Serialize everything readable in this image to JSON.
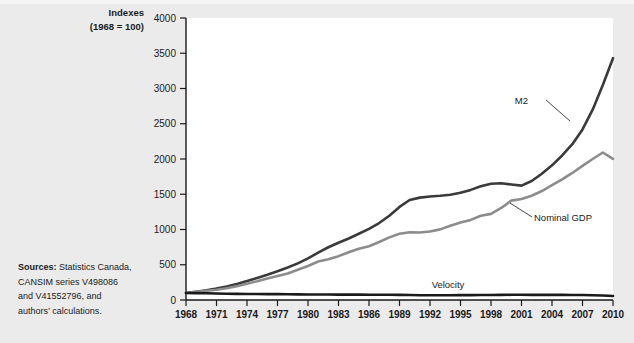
{
  "figure": {
    "background_color": "#ebebeb",
    "plot_background_color": "#ffffff",
    "axis_title_line1": "Indexes",
    "axis_title_line2": "(1968 = 100)"
  },
  "sources": {
    "label": "Sources:",
    "lines": [
      "Statistics Canada,",
      "CANSIM series V498086",
      "and V41552796, and",
      "authors’ calculations."
    ],
    "full_text": "Sources: Statistics Canada, CANSIM series V498086 and V41552796, and authors’ calculations."
  },
  "chart_data": {
    "type": "line",
    "title": "",
    "subtitle": "",
    "xlabel": "",
    "ylabel": "Indexes (1968 = 100)",
    "xlim": [
      1968,
      2010
    ],
    "ylim": [
      0,
      4000
    ],
    "grid": false,
    "legend_position": "inline-annotations",
    "ytick_labels": [
      "0",
      "500",
      "1000",
      "1500",
      "2000",
      "2500",
      "3000",
      "3500",
      "4000"
    ],
    "yticks": [
      0,
      500,
      1000,
      1500,
      2000,
      2500,
      3000,
      3500,
      4000
    ],
    "xtick_labels": [
      "1968",
      "1971",
      "1974",
      "1977",
      "1980",
      "1983",
      "1986",
      "1989",
      "1992",
      "1995",
      "1998",
      "2001",
      "2004",
      "2007",
      "2010"
    ],
    "xticks": [
      1968,
      1971,
      1974,
      1977,
      1980,
      1983,
      1986,
      1989,
      1992,
      1995,
      1998,
      2001,
      2004,
      2007,
      2010
    ],
    "x": [
      1968,
      1969,
      1970,
      1971,
      1972,
      1973,
      1974,
      1975,
      1976,
      1977,
      1978,
      1979,
      1980,
      1981,
      1982,
      1983,
      1984,
      1985,
      1986,
      1987,
      1988,
      1989,
      1990,
      1991,
      1992,
      1993,
      1994,
      1995,
      1996,
      1997,
      1998,
      1999,
      2000,
      2001,
      2002,
      2003,
      2004,
      2005,
      2006,
      2007,
      2008,
      2009,
      2010
    ],
    "series": [
      {
        "name": "M2",
        "label": "M2",
        "color": "#3a3a3a",
        "width": 2.6,
        "values": [
          100,
          118,
          138,
          162,
          192,
          228,
          268,
          312,
          358,
          408,
          462,
          520,
          590,
          672,
          748,
          812,
          872,
          940,
          1010,
          1092,
          1196,
          1320,
          1418,
          1452,
          1468,
          1478,
          1492,
          1520,
          1562,
          1612,
          1650,
          1656,
          1638,
          1622,
          1688,
          1790,
          1910,
          2050,
          2210,
          2420,
          2700,
          3050,
          3430
        ]
      },
      {
        "name": "Nominal GDP",
        "label": "Nominal GDP",
        "color": "#8c8c8c",
        "width": 2.6,
        "values": [
          100,
          116,
          130,
          146,
          166,
          196,
          232,
          266,
          306,
          340,
          376,
          428,
          482,
          546,
          578,
          622,
          676,
          726,
          762,
          822,
          888,
          940,
          962,
          958,
          972,
          1002,
          1054,
          1098,
          1136,
          1196,
          1222,
          1306,
          1410,
          1432,
          1478,
          1546,
          1628,
          1712,
          1802,
          1902,
          2000,
          2092,
          2002
        ]
      },
      {
        "name": "Velocity",
        "label": "Velocity",
        "color": "#1a1a1a",
        "width": 2.6,
        "values": [
          100,
          98,
          95,
          92,
          89,
          87,
          86,
          85,
          84,
          83,
          81,
          80,
          79,
          79,
          77,
          76,
          76,
          76,
          75,
          75,
          74,
          73,
          70,
          68,
          67,
          67,
          68,
          69,
          69,
          70,
          70,
          72,
          74,
          74,
          73,
          73,
          73,
          72,
          71,
          70,
          67,
          63,
          56
        ]
      }
    ],
    "annotations": [
      {
        "text": "M2",
        "for_series": "M2",
        "label_x": 528,
        "label_y": 104,
        "leader_from_x": 546,
        "leader_from_y": 100,
        "leader_to_x": 570,
        "leader_to_y": 121
      },
      {
        "text": "Nominal GDP",
        "for_series": "Nominal GDP",
        "label_x": 534,
        "label_y": 221,
        "leader_from_x": 532,
        "leader_from_y": 217,
        "leader_to_x": 510,
        "leader_to_y": 203
      },
      {
        "text": "Velocity",
        "for_series": "Velocity",
        "label_x": 448,
        "label_y": 288,
        "leader_from_x": null,
        "leader_from_y": null,
        "leader_to_x": null,
        "leader_to_y": null
      }
    ]
  },
  "geometry": {
    "plot_left": 186,
    "plot_right": 613,
    "plot_top": 18,
    "plot_bottom": 300
  }
}
